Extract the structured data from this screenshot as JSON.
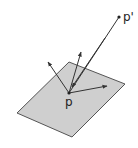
{
  "diagram": {
    "type": "geometric-vector-diagram",
    "colors": {
      "plane_fill": "#cfcfcf",
      "plane_stroke": "#555555",
      "line": "#333333",
      "background": "#ffffff"
    },
    "plane": {
      "points": "69,62 125,84 72,137 17,113"
    },
    "point_p": {
      "label": "p",
      "x": 69,
      "y": 93
    },
    "point_p_prime": {
      "label": "p'",
      "x": 119,
      "y": 17
    },
    "arrows": [
      {
        "name": "arrow-left",
        "x2": 48,
        "y2": 62
      },
      {
        "name": "arrow-up",
        "x2": 81,
        "y2": 52
      },
      {
        "name": "arrow-right",
        "x2": 107,
        "y2": 86
      }
    ]
  }
}
